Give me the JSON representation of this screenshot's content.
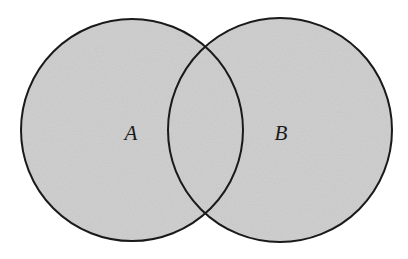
{
  "diagram": {
    "type": "venn",
    "sets": [
      {
        "label": "A",
        "cx": 132,
        "cy": 130,
        "r": 111
      },
      {
        "label": "B",
        "cx": 280,
        "cy": 130,
        "r": 112
      }
    ],
    "fill_color": "#c8c8c8",
    "stroke_color": "#1a1a1a",
    "background": "#ffffff"
  }
}
